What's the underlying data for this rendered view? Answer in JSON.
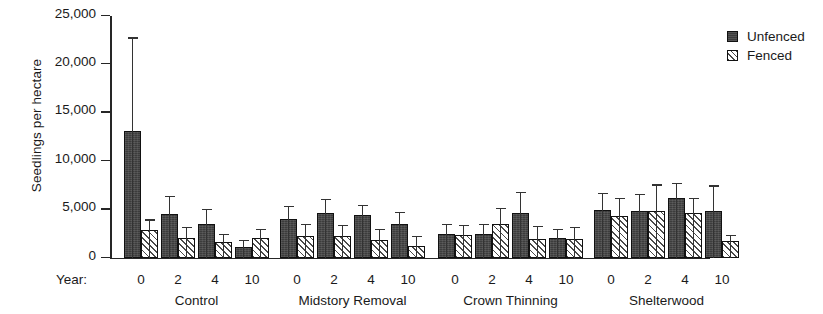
{
  "chart_data": {
    "type": "bar",
    "title": "",
    "xlabel": "Year:",
    "ylabel": "Seedlings per hectare",
    "ylim": [
      0,
      25000
    ],
    "yticks": [
      0,
      5000,
      10000,
      15000,
      20000,
      25000
    ],
    "ytick_labels": [
      "0",
      "5,000",
      "10,000",
      "15,000",
      "20,000",
      "25,000"
    ],
    "grid": false,
    "legend_position": "top-right",
    "groups": [
      "Control",
      "Midstory Removal",
      "Crown Thinning",
      "Shelterwood"
    ],
    "categories": [
      "0",
      "2",
      "4",
      "10"
    ],
    "series": [
      {
        "name": "Unfenced",
        "color": "#3c3c3c",
        "fill": "solid-dark",
        "values": [
          [
            13100,
            4500,
            3500,
            1100
          ],
          [
            4000,
            4700,
            4400,
            3500
          ],
          [
            2500,
            2500,
            4600,
            2100
          ],
          [
            5000,
            4900,
            6200,
            4900
          ]
        ],
        "errors_upper": [
          [
            22800,
            6400,
            5100,
            1900
          ],
          [
            5400,
            6100,
            5500,
            4800
          ],
          [
            3500,
            3500,
            6800,
            3000
          ],
          [
            6700,
            6600,
            7800,
            7500
          ]
        ]
      },
      {
        "name": "Fenced",
        "color": "#e9e9e9",
        "fill": "diagonal-hatch",
        "values": [
          [
            2900,
            2100,
            1700,
            2100
          ],
          [
            2300,
            2300,
            1900,
            1200
          ],
          [
            2400,
            3500,
            2000,
            2000
          ],
          [
            4300,
            4900,
            4600,
            1800
          ]
        ],
        "errors_upper": [
          [
            4000,
            3200,
            2500,
            3000
          ],
          [
            3500,
            3400,
            3000,
            2300
          ],
          [
            3400,
            5200,
            3300,
            3200
          ],
          [
            6200,
            7600,
            6200,
            2400
          ]
        ]
      }
    ]
  },
  "legend": {
    "entries": [
      {
        "label": "Unfenced",
        "swatch": "unfenced"
      },
      {
        "label": "Fenced",
        "swatch": "fenced"
      }
    ]
  },
  "axis": {
    "year_prefix": "Year:"
  }
}
